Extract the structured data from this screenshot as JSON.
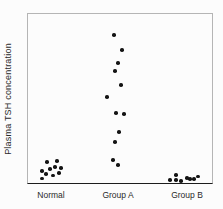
{
  "chart_data": {
    "type": "scatter",
    "subtype": "strip-plot",
    "title": "",
    "xlabel": "",
    "ylabel": "Plasma TSH concentration",
    "categories": [
      "Normal",
      "Group A",
      "Group B"
    ],
    "y_axis_ticks": "none (arbitrary units, no numeric scale shown)",
    "grid": false,
    "legend": "none",
    "plot_box_px": {
      "left": 27,
      "top": 13,
      "right": 213,
      "bottom": 184
    },
    "group_centers_px": [
      51,
      118,
      187
    ],
    "groups": [
      {
        "label": "Normal",
        "n": 10,
        "points": [
          {
            "x": 47,
            "y": 162,
            "v": 12.9
          },
          {
            "x": 57,
            "y": 161,
            "v": 13.5
          },
          {
            "x": 42,
            "y": 171,
            "v": 7.6
          },
          {
            "x": 50,
            "y": 169,
            "v": 8.8
          },
          {
            "x": 55,
            "y": 167,
            "v": 9.9
          },
          {
            "x": 61,
            "y": 168,
            "v": 9.4
          },
          {
            "x": 46,
            "y": 174,
            "v": 5.8
          },
          {
            "x": 53,
            "y": 175.5,
            "v": 5.0
          },
          {
            "x": 59,
            "y": 173,
            "v": 6.4
          },
          {
            "x": 42,
            "y": 178.5,
            "v": 3.2
          }
        ]
      },
      {
        "label": "Group A",
        "n": 12,
        "points": [
          {
            "x": 114,
            "y": 35,
            "v": 87.1
          },
          {
            "x": 122,
            "y": 50,
            "v": 78.4
          },
          {
            "x": 118,
            "y": 63,
            "v": 70.8
          },
          {
            "x": 115,
            "y": 71,
            "v": 66.1
          },
          {
            "x": 121,
            "y": 85,
            "v": 57.9
          },
          {
            "x": 107,
            "y": 97,
            "v": 50.9
          },
          {
            "x": 116,
            "y": 113,
            "v": 41.5
          },
          {
            "x": 124,
            "y": 114,
            "v": 40.9
          },
          {
            "x": 119,
            "y": 132,
            "v": 30.4
          },
          {
            "x": 115,
            "y": 142,
            "v": 24.6
          },
          {
            "x": 113,
            "y": 160,
            "v": 14.0
          },
          {
            "x": 118,
            "y": 165,
            "v": 11.1
          }
        ]
      },
      {
        "label": "Group B",
        "n": 8,
        "points": [
          {
            "x": 170,
            "y": 180,
            "v": 2.3
          },
          {
            "x": 176,
            "y": 175,
            "v": 5.3
          },
          {
            "x": 176,
            "y": 180,
            "v": 2.3
          },
          {
            "x": 181,
            "y": 181,
            "v": 1.8
          },
          {
            "x": 187,
            "y": 178,
            "v": 3.5
          },
          {
            "x": 190,
            "y": 179,
            "v": 2.9
          },
          {
            "x": 194,
            "y": 179,
            "v": 2.9
          },
          {
            "x": 198,
            "y": 176.5,
            "v": 4.4
          }
        ]
      }
    ],
    "colors": {
      "dot": "#141414",
      "frame": "#b5b5b5",
      "baseline": "#1c1c1c",
      "text": "#2a2a2a",
      "background": "#fcfcfc"
    }
  }
}
